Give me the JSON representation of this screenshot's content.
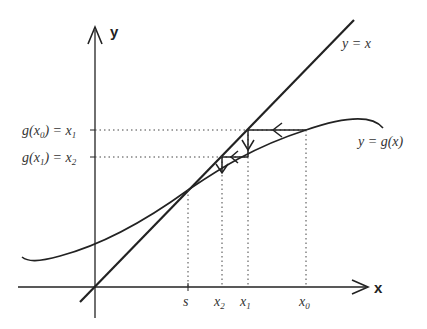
{
  "diagram": {
    "axes": {
      "x_label": "x",
      "y_label": "y"
    },
    "curves": [
      {
        "name": "identity-line",
        "label": "y = x"
      },
      {
        "name": "g-curve",
        "label": "y = g(x)"
      }
    ],
    "y_tick_labels": [
      {
        "left": "g(x",
        "sub": "0",
        "right": ") = x",
        "sub2": "1"
      },
      {
        "left": "g(x",
        "sub": "1",
        "right": ") = x",
        "sub2": "2"
      }
    ],
    "x_tick_labels": [
      {
        "main": "s",
        "sub": ""
      },
      {
        "main": "x",
        "sub": "2"
      },
      {
        "main": "x",
        "sub": "1"
      },
      {
        "main": "x",
        "sub": "0"
      }
    ],
    "colors": {
      "line": "#222222",
      "dotted": "#444444",
      "text": "#333333"
    }
  }
}
